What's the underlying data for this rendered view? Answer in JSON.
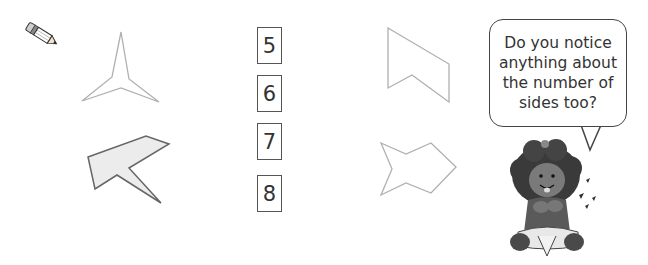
{
  "icons": {
    "pencil": "pencil-icon"
  },
  "shapes": [
    {
      "name": "star-three-point",
      "sides": 6,
      "fill": "none",
      "stroke": "#aaaaaa"
    },
    {
      "name": "arrow-shape-grey",
      "sides": 7,
      "fill": "#ececec",
      "stroke": "#666666"
    },
    {
      "name": "flag-shape",
      "sides": 5,
      "fill": "none",
      "stroke": "#aaaaaa"
    },
    {
      "name": "fish-shape",
      "sides": 8,
      "fill": "none",
      "stroke": "#aaaaaa"
    }
  ],
  "number_options": [
    {
      "label": "5"
    },
    {
      "label": "6"
    },
    {
      "label": "7"
    },
    {
      "label": "8"
    }
  ],
  "speech_bubble": {
    "lines": [
      "Do you notice",
      "anything about",
      "the number of",
      "sides too?"
    ]
  },
  "character": {
    "name": "girl-character"
  }
}
